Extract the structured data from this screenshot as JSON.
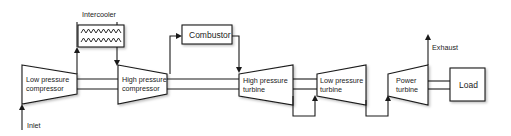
{
  "diagram": {
    "components": {
      "intercooler": {
        "label": "Intercooler"
      },
      "combustor": {
        "label": "Combustor"
      },
      "lp_compressor": {
        "line1": "Low pressure",
        "line2": "compressor"
      },
      "hp_compressor": {
        "line1": "High pressure",
        "line2": "compressor"
      },
      "hp_turbine": {
        "line1": "High pressure",
        "line2": "turbine"
      },
      "lp_turbine": {
        "line1": "Low pressure",
        "line2": "turbine"
      },
      "power_turbine": {
        "line1": "Power",
        "line2": "turbine"
      },
      "load": {
        "label": "Load"
      }
    },
    "flows": {
      "inlet": {
        "label": "Inlet"
      },
      "exhaust": {
        "label": "Exhaust"
      }
    },
    "colors": {
      "stroke": "#1a1a1a",
      "fill": "#ffffff",
      "text": "#222222"
    }
  }
}
